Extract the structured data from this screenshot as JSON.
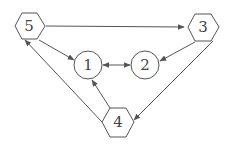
{
  "diagram": {
    "type": "directed-graph",
    "colors": {
      "stroke": "#555555",
      "fill": "#ffffff",
      "text": "#444444"
    },
    "nodes": [
      {
        "id": "1",
        "label": "1",
        "shape": "circle",
        "cx": 88,
        "cy": 65
      },
      {
        "id": "2",
        "label": "2",
        "shape": "circle",
        "cx": 145,
        "cy": 65
      },
      {
        "id": "3",
        "label": "3",
        "shape": "hexagon",
        "cx": 203,
        "cy": 27
      },
      {
        "id": "4",
        "label": "4",
        "shape": "hexagon",
        "cx": 118,
        "cy": 122
      },
      {
        "id": "5",
        "label": "5",
        "shape": "hexagon",
        "cx": 29,
        "cy": 26
      }
    ],
    "edges": [
      {
        "from": "5",
        "to": "3",
        "direction": "forward"
      },
      {
        "from": "5",
        "to": "1",
        "direction": "forward"
      },
      {
        "from": "1",
        "to": "2",
        "direction": "both"
      },
      {
        "from": "3",
        "to": "2",
        "direction": "forward"
      },
      {
        "from": "3",
        "to": "4",
        "direction": "forward"
      },
      {
        "from": "4",
        "to": "1",
        "direction": "forward"
      },
      {
        "from": "4",
        "to": "5",
        "direction": "forward"
      }
    ]
  }
}
